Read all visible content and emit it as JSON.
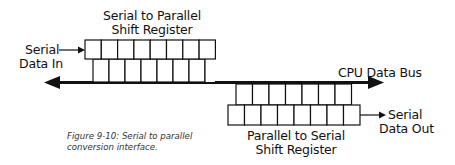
{
  "figure": {
    "caption_line1": "Figure 9-10: Serial to parallel",
    "caption_line2": "conversion interface."
  },
  "labels": {
    "sipo_line1": "Serial to Parallel",
    "sipo_line2": "Shift Register",
    "serial_in_line1": "Serial",
    "serial_in_line2": "Data In",
    "bus": "CPU Data Bus",
    "piso_line1": "Parallel to Serial",
    "piso_line2": "Shift Register",
    "serial_out_line1": "Serial",
    "serial_out_line2": "Data Out"
  },
  "registers": {
    "sipo_cells": 8,
    "piso_cells": 8
  },
  "colors": {
    "stroke": "#111111",
    "background": "#ffffff"
  }
}
